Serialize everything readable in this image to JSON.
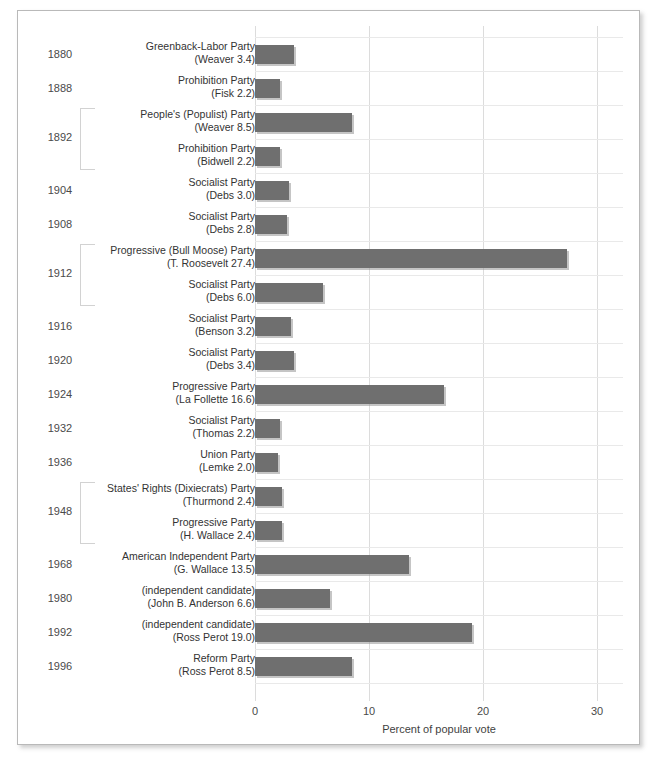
{
  "chart_data": {
    "type": "bar",
    "orientation": "horizontal",
    "title": "",
    "xlabel": "Percent of popular vote",
    "ylabel": "",
    "xlim": [
      0,
      30
    ],
    "xticks": [
      "0",
      "10",
      "20",
      "30"
    ],
    "xtick_values": [
      0,
      10,
      20,
      30
    ],
    "grid": true,
    "legend": "none",
    "bar_color": "#6f6f6f",
    "gridline_color": "#e9e9e9",
    "categories": [
      "Greenback-Labor Party (Weaver)",
      "Prohibition Party (Fisk)",
      "People's (Populist) Party (Weaver)",
      "Prohibition Party (Bidwell)",
      "Socialist Party (Debs)",
      "Socialist Party (Debs)",
      "Progressive (Bull Moose) Party (T. Roosevelt)",
      "Socialist Party (Debs)",
      "Socialist Party (Benson)",
      "Socialist Party (Debs)",
      "Progressive Party (La Follette)",
      "Socialist Party (Thomas)",
      "Union Party (Lemke)",
      "States' Rights (Dixiecrats) Party (Thurmond)",
      "Progressive Party (H. Wallace)",
      "American Independent Party (G. Wallace)",
      "(independent candidate) (John B. Anderson)",
      "(independent candidate) (Ross Perot)",
      "Reform Party (Ross Perot)"
    ],
    "values": [
      3.4,
      2.2,
      8.5,
      2.2,
      3.0,
      2.8,
      27.4,
      6.0,
      3.2,
      3.4,
      16.6,
      2.2,
      2.0,
      2.4,
      2.4,
      13.5,
      6.6,
      19.0,
      8.5
    ],
    "years": [
      1880,
      1888,
      1892,
      1892,
      1904,
      1908,
      1912,
      1912,
      1916,
      1920,
      1924,
      1932,
      1936,
      1948,
      1948,
      1968,
      1980,
      1992,
      1996
    ]
  },
  "rows": [
    {
      "year": "1880",
      "line1": "Greenback-Labor Party",
      "line2": "(Weaver 3.4)",
      "value": 3.4,
      "show_year": true,
      "bracket": false
    },
    {
      "year": "1888",
      "line1": "Prohibition Party",
      "line2": "(Fisk 2.2)",
      "value": 2.2,
      "show_year": true,
      "bracket": false
    },
    {
      "year": "1892",
      "line1": "People's (Populist) Party",
      "line2": "(Weaver 8.5)",
      "value": 8.5,
      "show_year": false,
      "bracket": true
    },
    {
      "year": "",
      "line1": "Prohibition Party",
      "line2": "(Bidwell 2.2)",
      "value": 2.2,
      "show_year": false,
      "bracket": false
    },
    {
      "year": "1904",
      "line1": "Socialist Party",
      "line2": "(Debs 3.0)",
      "value": 3.0,
      "show_year": true,
      "bracket": false
    },
    {
      "year": "1908",
      "line1": "Socialist Party",
      "line2": "(Debs 2.8)",
      "value": 2.8,
      "show_year": true,
      "bracket": false
    },
    {
      "year": "1912",
      "line1": "Progressive (Bull Moose) Party",
      "line2": "(T. Roosevelt 27.4)",
      "value": 27.4,
      "show_year": false,
      "bracket": true
    },
    {
      "year": "",
      "line1": "Socialist Party",
      "line2": "(Debs 6.0)",
      "value": 6.0,
      "show_year": false,
      "bracket": false
    },
    {
      "year": "1916",
      "line1": "Socialist Party",
      "line2": "(Benson 3.2)",
      "value": 3.2,
      "show_year": true,
      "bracket": false
    },
    {
      "year": "1920",
      "line1": "Socialist Party",
      "line2": "(Debs 3.4)",
      "value": 3.4,
      "show_year": true,
      "bracket": false
    },
    {
      "year": "1924",
      "line1": "Progressive Party",
      "line2": "(La Follette 16.6)",
      "value": 16.6,
      "show_year": true,
      "bracket": false
    },
    {
      "year": "1932",
      "line1": "Socialist Party",
      "line2": "(Thomas 2.2)",
      "value": 2.2,
      "show_year": true,
      "bracket": false
    },
    {
      "year": "1936",
      "line1": "Union Party",
      "line2": "(Lemke 2.0)",
      "value": 2.0,
      "show_year": true,
      "bracket": false
    },
    {
      "year": "1948",
      "line1": "States' Rights (Dixiecrats) Party",
      "line2": "(Thurmond 2.4)",
      "value": 2.4,
      "show_year": false,
      "bracket": true
    },
    {
      "year": "",
      "line1": "Progressive Party",
      "line2": "(H. Wallace 2.4)",
      "value": 2.4,
      "show_year": false,
      "bracket": false
    },
    {
      "year": "1968",
      "line1": "American Independent Party",
      "line2": "(G. Wallace 13.5)",
      "value": 13.5,
      "show_year": true,
      "bracket": false
    },
    {
      "year": "1980",
      "line1": "(independent candidate)",
      "line2": "(John B. Anderson 6.6)",
      "value": 6.6,
      "show_year": true,
      "bracket": false
    },
    {
      "year": "1992",
      "line1": "(independent candidate)",
      "line2": "(Ross Perot 19.0)",
      "value": 19.0,
      "show_year": true,
      "bracket": false
    },
    {
      "year": "1996",
      "line1": "Reform Party",
      "line2": "(Ross Perot 8.5)",
      "value": 8.5,
      "show_year": true,
      "bracket": false
    }
  ],
  "bracket_years": [
    {
      "label": "1892",
      "start_row": 2,
      "span": 2
    },
    {
      "label": "1912",
      "start_row": 6,
      "span": 2
    },
    {
      "label": "1948",
      "start_row": 13,
      "span": 2
    }
  ],
  "axis": {
    "title": "Percent of popular vote",
    "ticks": [
      "0",
      "10",
      "20",
      "30"
    ]
  }
}
